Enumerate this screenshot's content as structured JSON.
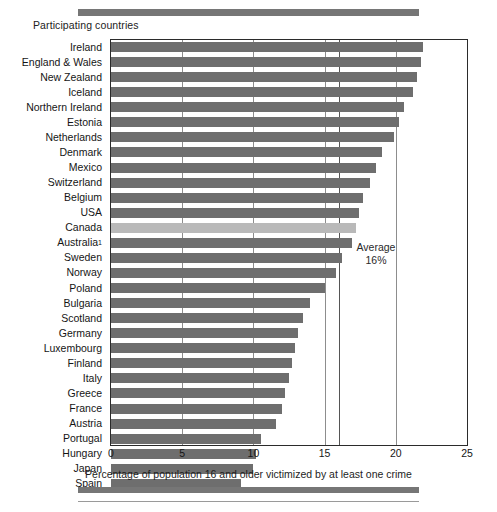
{
  "figure": {
    "caption_top": "Participating countries",
    "axis_title": "Percentage of population 16 and older victimized by at least one crime",
    "average_label": "Average",
    "average_value_label": "16%"
  },
  "colors": {
    "bar": "#6e6e6e",
    "bar_highlight": "#b9b9b9",
    "frame": "#2b2b2b",
    "grid": "#8d8d8d",
    "rule": "#767676"
  },
  "chart_data": {
    "type": "bar",
    "orientation": "horizontal",
    "title": "Participating countries",
    "xlabel": "Percentage of population 16 and older victimized by at least one crime",
    "ylabel": "",
    "xlim": [
      0,
      25
    ],
    "xticks": [
      0,
      5,
      10,
      15,
      20,
      25
    ],
    "xtick_labels": [
      "0",
      "5",
      "10",
      "15",
      "20",
      "25"
    ],
    "grid": true,
    "legend": "none",
    "highlight_category": "Canada",
    "annotations": [
      {
        "text": "Average 16%",
        "x": 16,
        "note": "vertical reference line at 16%"
      }
    ],
    "reference_line": 16,
    "categories": [
      "Ireland",
      "England & Wales",
      "New Zealand",
      "Iceland",
      "Northern Ireland",
      "Estonia",
      "Netherlands",
      "Denmark",
      "Mexico",
      "Switzerland",
      "Belgium",
      "USA",
      "Canada",
      "Australia¹",
      "Sweden",
      "Norway",
      "Poland",
      "Bulgaria",
      "Scotland",
      "Germany",
      "Luxembourg",
      "Finland",
      "Italy",
      "Greece",
      "France",
      "Austria",
      "Portugal",
      "Hungary",
      "Japan",
      "Spain"
    ],
    "values": [
      21.9,
      21.8,
      21.5,
      21.2,
      20.6,
      20.2,
      19.9,
      19.0,
      18.6,
      18.2,
      17.7,
      17.4,
      17.2,
      16.9,
      16.2,
      15.8,
      15.0,
      14.0,
      13.5,
      13.1,
      12.9,
      12.7,
      12.5,
      12.2,
      12.0,
      11.6,
      10.5,
      10.2,
      10.0,
      9.1
    ],
    "value_unit": "percent"
  }
}
